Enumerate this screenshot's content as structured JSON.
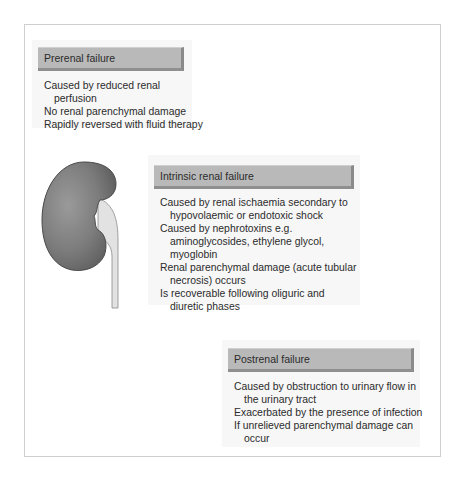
{
  "figure": {
    "panels": [
      {
        "id": "prerenal",
        "title": "Prerenal failure",
        "items": [
          "Caused by reduced renal perfusion",
          "No renal parenchymal damage",
          "Rapidly reversed with fluid therapy"
        ]
      },
      {
        "id": "intrinsic",
        "title": "Intrinsic renal failure",
        "items": [
          "Caused by renal ischaemia secondary to hypovolaemic or endotoxic shock",
          "Caused by nephrotoxins e.g. aminoglycosides, ethylene glycol, myoglobin",
          "Renal parenchymal damage (acute tubular necrosis) occurs",
          "Is recoverable following oliguric and diuretic phases"
        ]
      },
      {
        "id": "postrenal",
        "title": "Postrenal failure",
        "items": [
          "Caused by obstruction to urinary flow in the urinary tract",
          "Exacerbated by the presence of infection",
          "If unrelieved parenchymal damage can occur"
        ]
      }
    ],
    "illustration": "kidney-with-ureter",
    "colors": {
      "header_fill": "#b9b9b9",
      "header_shadow": "#8a8a8a",
      "panel_fill": "#f7f7f7",
      "kidney_fill": "#7a7a7a",
      "ureter_fill": "#e2e2e2",
      "frame_border": "#cfcfcf"
    }
  }
}
